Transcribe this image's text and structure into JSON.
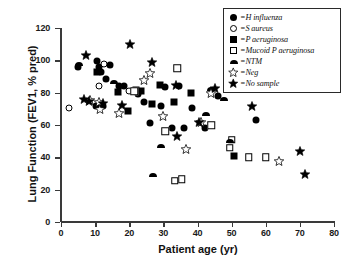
{
  "chart_data": {
    "type": "scatter",
    "title": "",
    "xlabel": "Patient age (yr)",
    "ylabel": "Lung Function (FEV1, % pred)",
    "xlim": [
      0,
      80
    ],
    "ylim": [
      0,
      120
    ],
    "xticks": [
      0,
      10,
      20,
      30,
      40,
      50,
      60,
      70,
      80
    ],
    "yticks": [
      0,
      20,
      40,
      60,
      80,
      100,
      120
    ],
    "grid": false,
    "legend_position": "top-right",
    "series": [
      {
        "name": "H influenza",
        "marker": "filled-circle",
        "points": [
          [
            5.0,
            96.0
          ],
          [
            10.6,
            99.5
          ],
          [
            11.2,
            96.0
          ],
          [
            11.6,
            92.5
          ],
          [
            13.2,
            88.5
          ],
          [
            14.4,
            97.0
          ],
          [
            10.2,
            72.0
          ],
          [
            12.2,
            71.5
          ],
          [
            17.0,
            84.0
          ],
          [
            18.4,
            84.0
          ],
          [
            22.6,
            79.0
          ],
          [
            24.4,
            74.0
          ],
          [
            26.0,
            61.0
          ],
          [
            29.2,
            72.0
          ],
          [
            32.6,
            58.0
          ],
          [
            36.0,
            58.0
          ],
          [
            38.4,
            70.5
          ],
          [
            42.2,
            58.0
          ],
          [
            46.0,
            78.0
          ],
          [
            57.0,
            63.0
          ],
          [
            30.4,
            83.5
          ],
          [
            34.6,
            84.0
          ]
        ]
      },
      {
        "name": "S aureus",
        "marker": "open-circle",
        "points": [
          [
            2.4,
            70.5
          ],
          [
            12.6,
            98.0
          ],
          [
            20.0,
            81.0
          ],
          [
            11.0,
            84.0
          ]
        ]
      },
      {
        "name": "P aeruginosa",
        "marker": "filled-square",
        "points": [
          [
            10.6,
            93.0
          ],
          [
            16.8,
            80.5
          ],
          [
            22.0,
            81.5
          ],
          [
            23.4,
            81.0
          ],
          [
            19.6,
            68.5
          ],
          [
            29.0,
            84.5
          ],
          [
            26.6,
            73.0
          ],
          [
            50.6,
            41.0
          ],
          [
            38.0,
            80.0
          ],
          [
            33.0,
            74.0
          ]
        ]
      },
      {
        "name": "Mucoid P aeruginosa",
        "marker": "open-square",
        "points": [
          [
            21.4,
            81.0
          ],
          [
            34.0,
            95.0
          ],
          [
            44.0,
            60.0
          ],
          [
            50.0,
            51.0
          ],
          [
            49.4,
            46.0
          ],
          [
            55.0,
            40.0
          ],
          [
            33.4,
            25.5
          ],
          [
            35.4,
            26.5
          ],
          [
            30.6,
            56.0
          ],
          [
            60.0,
            40.0
          ]
        ]
      },
      {
        "name": "NTM",
        "marker": "half-circle",
        "points": [
          [
            5.2,
            97.5
          ],
          [
            15.4,
            86.5
          ],
          [
            29.4,
            47.0
          ],
          [
            44.0,
            82.0
          ],
          [
            47.8,
            76.0
          ],
          [
            49.6,
            50.0
          ],
          [
            42.4,
            67.0
          ],
          [
            27.0,
            29.0
          ]
        ]
      },
      {
        "name": "Neg",
        "marker": "open-star",
        "points": [
          [
            8.6,
            75.5
          ],
          [
            11.0,
            74.5
          ],
          [
            11.4,
            70.0
          ],
          [
            17.0,
            67.5
          ],
          [
            24.4,
            88.0
          ],
          [
            30.0,
            65.5
          ],
          [
            41.0,
            62.0
          ],
          [
            44.0,
            80.0
          ],
          [
            36.6,
            45.0
          ],
          [
            64.0,
            38.0
          ],
          [
            26.0,
            92.0
          ]
        ]
      },
      {
        "name": "No sample",
        "marker": "filled-star",
        "points": [
          [
            7.4,
            103.0
          ],
          [
            20.2,
            110.0
          ],
          [
            6.8,
            76.0
          ],
          [
            8.2,
            75.0
          ],
          [
            12.2,
            73.5
          ],
          [
            18.0,
            72.5
          ],
          [
            33.8,
            85.0
          ],
          [
            40.4,
            62.0
          ],
          [
            34.0,
            53.0
          ],
          [
            45.0,
            83.0
          ],
          [
            70.0,
            44.0
          ],
          [
            26.6,
            99.0
          ],
          [
            56.0,
            72.0
          ],
          [
            71.6,
            29.5
          ]
        ]
      }
    ]
  },
  "legend": {
    "items": [
      {
        "marker": "filled-circle",
        "label": "=H influenza"
      },
      {
        "marker": "open-circle",
        "label": "=S aureus"
      },
      {
        "marker": "filled-square",
        "label": "=P aeruginosa"
      },
      {
        "marker": "open-square",
        "label": "=Mucoid P aeruginosa"
      },
      {
        "marker": "half-circle",
        "label": "=NTM"
      },
      {
        "marker": "open-star",
        "label": "=Neg"
      },
      {
        "marker": "filled-star",
        "label": "=No sample"
      }
    ]
  },
  "colors": {
    "marker": "#000000",
    "axis": "#3a3a3a",
    "background": "#ffffff"
  }
}
